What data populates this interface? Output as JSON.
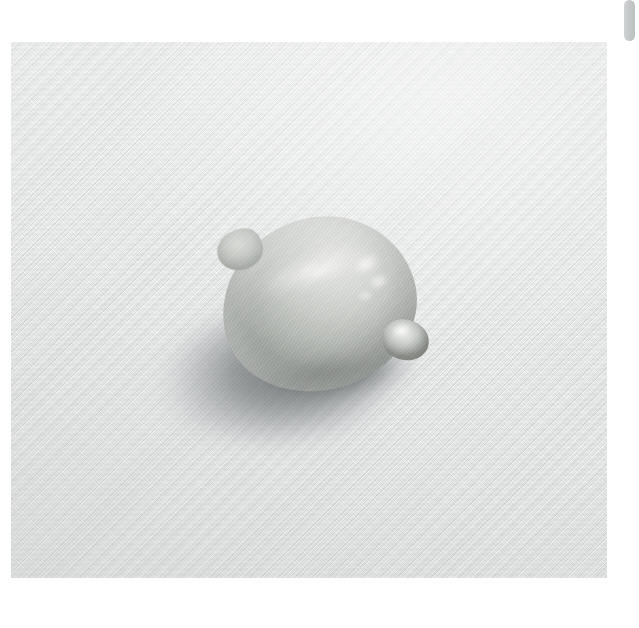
{
  "viewer": {
    "background_color": "#ffffff",
    "width": 639,
    "height": 628
  },
  "photo": {
    "alt_text": "A single lemon resting on a light gray woven fabric surface, lit from the upper right, casting a soft elliptical shadow to the lower left",
    "subject": "lemon",
    "surface": "woven cotton fabric",
    "orientation": "landscape",
    "frame": {
      "left": 11,
      "top": 42,
      "width": 596,
      "height": 536
    },
    "palette": {
      "background_light": "#f2f3f3",
      "background_mid": "#e8e9e9",
      "background_dark": "#dedfdf",
      "lemon_highlight": "#e4e5e2",
      "lemon_mid": "#cacdc8",
      "lemon_shadow": "#9ba09b",
      "cast_shadow": "#767a7c",
      "contact_shadow": "#54585a"
    },
    "lighting": {
      "key_direction": "upper-right",
      "shadow_direction": "lower-left",
      "specular_count": 4
    }
  },
  "scrollbar": {
    "orientation": "vertical",
    "thumb_color": "#c6c9c9",
    "track_color": "#ffffff",
    "position_percent": 0
  }
}
